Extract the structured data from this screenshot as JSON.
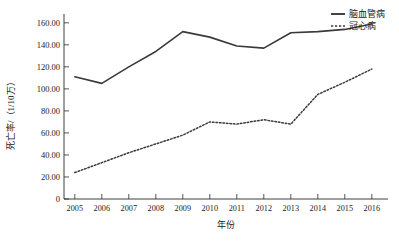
{
  "chart_data": {
    "type": "line",
    "title": "",
    "xlabel": "年份",
    "ylabel": "死亡率/（1/10万）",
    "x": [
      2005,
      2006,
      2007,
      2008,
      2009,
      2010,
      2011,
      2012,
      2013,
      2014,
      2015,
      2016
    ],
    "xtick_labels": [
      "2005",
      "2006",
      "2007",
      "2008",
      "2009",
      "2010",
      "2011",
      "2012",
      "2013",
      "2014",
      "2015",
      "2016"
    ],
    "ytick_labels": [
      "0",
      "20.00",
      "40.00",
      "60.00",
      "80.00",
      "100.00",
      "120.00",
      "140.00",
      "160.00"
    ],
    "ytick_values": [
      0,
      20,
      40,
      60,
      80,
      100,
      120,
      140,
      160
    ],
    "ylim": [
      0,
      168
    ],
    "xlim": [
      2004.6,
      2016.6
    ],
    "grid": false,
    "legend_position": "top-right",
    "series": [
      {
        "name": "脑血管病",
        "style": "solid",
        "color": "#3a3a3a",
        "values": [
          111,
          105,
          120,
          134,
          152,
          147,
          139,
          137,
          151,
          152,
          154,
          159
        ]
      },
      {
        "name": "冠心病",
        "style": "dotted",
        "color": "#3a3a3a",
        "values": [
          24,
          33,
          42,
          50,
          58,
          70,
          68,
          72,
          68,
          95,
          106,
          118
        ]
      }
    ]
  },
  "legend": {
    "items": [
      {
        "label": "脑血管病",
        "style": "solid"
      },
      {
        "label": "冠心病",
        "style": "dotted"
      }
    ]
  },
  "axes": {
    "y_title": "死亡率/（1/10万）",
    "x_title": "年份"
  }
}
